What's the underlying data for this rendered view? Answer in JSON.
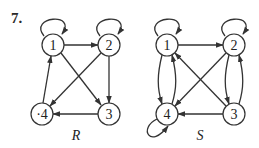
{
  "problem": {
    "number": "7."
  },
  "graphs": [
    {
      "id": "R",
      "label": "R",
      "nodes": [
        {
          "id": "1",
          "label": "1",
          "x": 53,
          "y": 45
        },
        {
          "id": "2",
          "label": "2",
          "x": 109,
          "y": 45
        },
        {
          "id": "3",
          "label": "3",
          "x": 109,
          "y": 114
        },
        {
          "id": "4",
          "label": "·4",
          "x": 42,
          "y": 114
        }
      ],
      "edges": [
        {
          "from": "1",
          "to": "1",
          "type": "loop"
        },
        {
          "from": "2",
          "to": "2",
          "type": "loop"
        },
        {
          "from": "1",
          "to": "2"
        },
        {
          "from": "1",
          "to": "3"
        },
        {
          "from": "2",
          "to": "3"
        },
        {
          "from": "2",
          "to": "4"
        },
        {
          "from": "3",
          "to": "4"
        },
        {
          "from": "4",
          "to": "1"
        }
      ]
    },
    {
      "id": "S",
      "label": "S",
      "nodes": [
        {
          "id": "1",
          "label": "1",
          "x": 167,
          "y": 45
        },
        {
          "id": "2",
          "label": "2",
          "x": 234,
          "y": 45
        },
        {
          "id": "3",
          "label": "3",
          "x": 234,
          "y": 114
        },
        {
          "id": "4",
          "label": "4",
          "x": 167,
          "y": 114
        }
      ],
      "edges": [
        {
          "from": "1",
          "to": "1",
          "type": "loop"
        },
        {
          "from": "2",
          "to": "2",
          "type": "loop"
        },
        {
          "from": "4",
          "to": "4",
          "type": "loop"
        },
        {
          "from": "1",
          "to": "2"
        },
        {
          "from": "1",
          "to": "4"
        },
        {
          "from": "4",
          "to": "1"
        },
        {
          "from": "2",
          "to": "3"
        },
        {
          "from": "3",
          "to": "2"
        },
        {
          "from": "2",
          "to": "4"
        },
        {
          "from": "3",
          "to": "1"
        },
        {
          "from": "3",
          "to": "4"
        }
      ]
    }
  ]
}
